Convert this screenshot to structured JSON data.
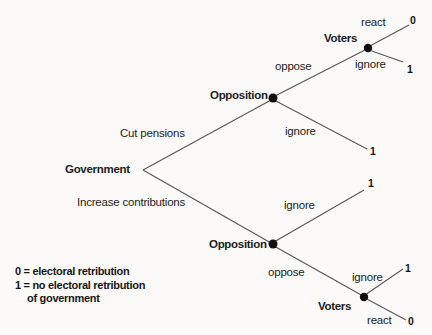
{
  "figure": {
    "background_color": "#fbfaf8",
    "line_color": "#565656",
    "text_color": "#1c1c1c"
  },
  "tree": {
    "root": {
      "label": "Government"
    },
    "nodes": {
      "opposition_top": {
        "label": "Opposition"
      },
      "voters_top": {
        "label": "Voters"
      },
      "opposition_bottom": {
        "label": "Opposition"
      },
      "voters_bottom": {
        "label": "Voters"
      }
    },
    "branches": {
      "cut_pensions": {
        "label": "Cut pensions"
      },
      "increase_contributions": {
        "label": "Increase contributions"
      },
      "oppose_top": {
        "label": "oppose"
      },
      "react_top": {
        "label": "react"
      },
      "ignore_voters_top": {
        "label": "ignore"
      },
      "ignore_opposition_top": {
        "label": "ignore"
      },
      "ignore_opposition_bottom": {
        "label": "ignore"
      },
      "oppose_bottom": {
        "label": "oppose"
      },
      "ignore_voters_bottom": {
        "label": "ignore"
      },
      "react_bottom": {
        "label": "react"
      }
    },
    "outcomes": {
      "react_top": "0",
      "ignore_voters_top": "1",
      "ignore_opposition_top": "1",
      "ignore_opposition_bottom": "1",
      "ignore_voters_bottom": "1",
      "react_bottom": "0"
    }
  },
  "legend": {
    "line1": "0 = electoral retribution",
    "line2": "1 = no electoral retribution",
    "line3": "of government"
  }
}
